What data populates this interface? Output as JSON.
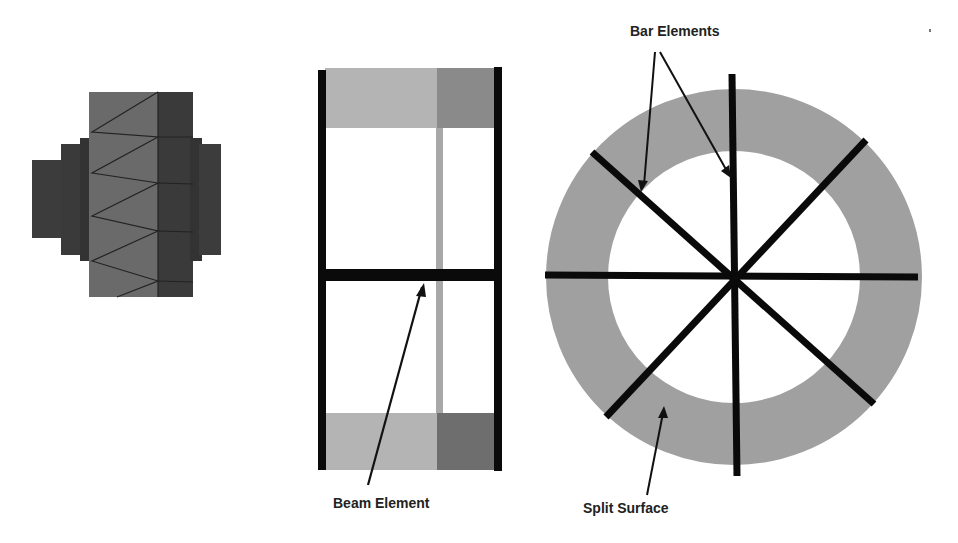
{
  "figures": {
    "left": {
      "name": "solid-mesh-model",
      "description": "Stepped cylinder cross-section with triangular mesh"
    },
    "middle": {
      "name": "beam-model",
      "annotation": "Beam Element"
    },
    "right": {
      "name": "ring-with-bars",
      "annotations": [
        "Bar Elements",
        "Split Surface"
      ]
    }
  },
  "labels": {
    "beam_element": "Beam Element",
    "bar_elements": "Bar Elements",
    "split_surface": "Split Surface"
  },
  "colors": {
    "dark_gray": "#3c3c3c",
    "mid_gray": "#666666",
    "light_gray": "#b4b4b4",
    "ring_gray": "#a0a0a0",
    "shade_gray": "#8a8a8a",
    "black": "#0a0a0a"
  }
}
